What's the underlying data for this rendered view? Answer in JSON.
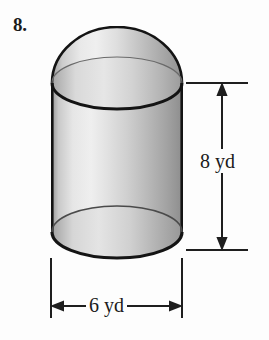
{
  "figure": {
    "problem_number": "8.",
    "shape_name": "cylinder-with-hemisphere-top",
    "fill_colors": {
      "body_light": "#f2f2f2",
      "body_mid": "#b9b9b9",
      "body_dark": "#8d8d8d",
      "outline": "#1a1a1a",
      "background": "#fdfdfd"
    },
    "dimensions": {
      "height": {
        "label": "8 yd",
        "value": 8,
        "unit": "yd",
        "orientation": "vertical",
        "arrow_style": "double-headed"
      },
      "width": {
        "label": "6 yd",
        "value": 6,
        "unit": "yd",
        "orientation": "horizontal",
        "arrow_style": "double-headed"
      }
    }
  }
}
